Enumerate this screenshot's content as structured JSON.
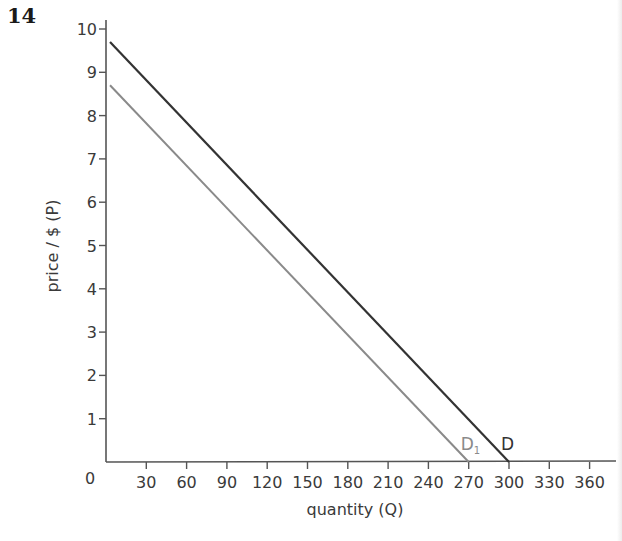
{
  "question_number": "14",
  "chart_data": {
    "type": "line",
    "title": "",
    "xlabel": "quantity (Q)",
    "ylabel": "price / $ (P)",
    "xlim": [
      0,
      375
    ],
    "ylim": [
      0,
      10
    ],
    "x_ticks": [
      30,
      60,
      90,
      120,
      150,
      180,
      210,
      240,
      270,
      300,
      330,
      360
    ],
    "y_ticks": [
      1,
      2,
      3,
      4,
      5,
      6,
      7,
      8,
      9,
      10
    ],
    "origin_label": "0",
    "grid": false,
    "legend": "inline labels at x-intercepts",
    "series": [
      {
        "name": "D",
        "label": "D",
        "color": "#333333",
        "equation": "P = 10 - Q/30",
        "points": [
          [
            3,
            9.7
          ],
          [
            300,
            0
          ]
        ]
      },
      {
        "name": "D1",
        "label": "D",
        "subscript": "1",
        "color": "#8a8a8a",
        "equation": "P = 9 - Q/30",
        "points": [
          [
            3,
            8.7
          ],
          [
            270,
            0
          ]
        ]
      }
    ]
  },
  "colors": {
    "axis": "#555555",
    "text": "#3a3a3a",
    "d_line": "#333333",
    "d1_line": "#8a8a8a"
  }
}
